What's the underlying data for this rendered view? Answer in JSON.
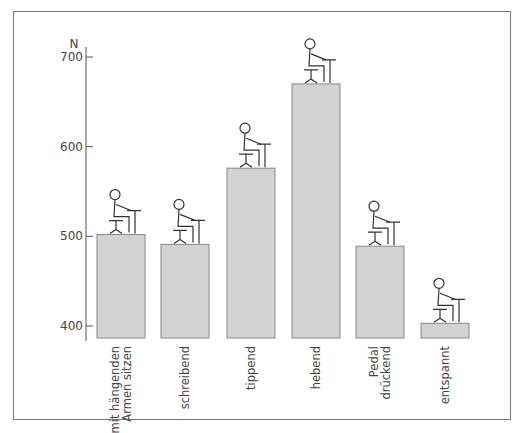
{
  "chart_data": {
    "type": "bar",
    "title": "",
    "xlabel": "",
    "ylabel": "N",
    "ylim": [
      390,
      720
    ],
    "yticks": [
      400,
      500,
      600,
      700
    ],
    "grid": false,
    "categories": [
      [
        "mit hängenden",
        "Armen sitzen"
      ],
      [
        "schreibend"
      ],
      [
        "tippend"
      ],
      [
        "hebend"
      ],
      [
        "Pedal",
        "drückend"
      ],
      [
        "entspannt"
      ]
    ],
    "values": [
      502,
      491,
      576,
      670,
      489,
      403
    ],
    "annotations": [
      "seated figure illustration atop each bar"
    ],
    "bar_color": "#d3d3d3"
  }
}
